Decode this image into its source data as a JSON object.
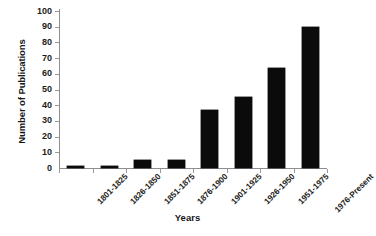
{
  "chart_data": {
    "type": "bar",
    "title": "",
    "xlabel": "Years",
    "ylabel": "Number of Publications",
    "categories": [
      "1801-1825",
      "1826-1850",
      "1851-1875",
      "1876-1900",
      "1901-1925",
      "1926-1950",
      "1951-1975",
      "1976-Present"
    ],
    "values": [
      1,
      1,
      5,
      5,
      37,
      45,
      64,
      90
    ],
    "ylim": [
      0,
      100
    ],
    "ytick_labels": [
      "100",
      "90",
      "80",
      "70",
      "60",
      "50",
      "40",
      "30",
      "20",
      "10",
      "0"
    ],
    "ytick_values": [
      100,
      90,
      80,
      70,
      60,
      50,
      40,
      30,
      20,
      10,
      0
    ],
    "grid": false,
    "legend": null,
    "bar_color": "#0b0b0b",
    "axis_color": "#8e8e91",
    "background_color": "#ffffff"
  }
}
